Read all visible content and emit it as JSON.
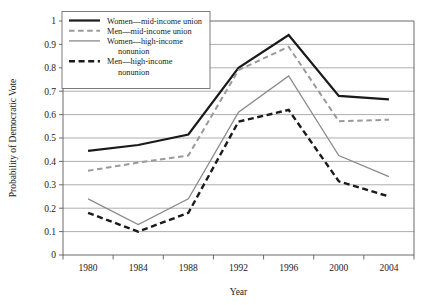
{
  "chart_data": {
    "type": "line",
    "title": "",
    "xlabel": "Year",
    "ylabel": "Probability of Democratic Vote",
    "categories": [
      "1980",
      "1984",
      "1988",
      "1992",
      "1996",
      "2000",
      "2004"
    ],
    "x": [
      1980,
      1984,
      1988,
      1992,
      1996,
      2000,
      2004
    ],
    "ylim": [
      0,
      1
    ],
    "yticks": [
      "0",
      "0.1",
      "0.2",
      "0.3",
      "0.4",
      "0.5",
      "0.6",
      "0.7",
      "0.8",
      "0.9",
      "1"
    ],
    "ytick_values": [
      0,
      0.1,
      0.2,
      0.3,
      0.4,
      0.5,
      0.6,
      0.7,
      0.8,
      0.9,
      1
    ],
    "grid": "horizontal",
    "legend_position": "top-left-inside",
    "series": [
      {
        "name": "Women—mid-income union",
        "values": [
          0.445,
          0.47,
          0.515,
          0.8,
          0.94,
          0.68,
          0.665
        ],
        "color": "#1a1a1a",
        "style": "solid",
        "width": 2.2
      },
      {
        "name": "Men—mid-income union",
        "values": [
          0.36,
          0.395,
          0.425,
          0.79,
          0.89,
          0.572,
          0.578
        ],
        "color": "#9a9a9a",
        "style": "dashed",
        "width": 2.0
      },
      {
        "name": "Women—high-income nonunion",
        "values": [
          0.24,
          0.13,
          0.24,
          0.61,
          0.765,
          0.425,
          0.335
        ],
        "color": "#8a8a8a",
        "style": "solid",
        "width": 1.3
      },
      {
        "name": "Men—high-income nonunion",
        "values": [
          0.18,
          0.1,
          0.18,
          0.57,
          0.62,
          0.315,
          0.25
        ],
        "color": "#1a1a1a",
        "style": "dashed",
        "width": 2.4
      }
    ]
  },
  "legend": {
    "entries": [
      {
        "line1": "Women—mid-income union",
        "line2": ""
      },
      {
        "line1": "Men—mid-income union",
        "line2": ""
      },
      {
        "line1": "Women—high-income",
        "line2": "nonunion"
      },
      {
        "line1": "Men—high-income",
        "line2": "nonunion"
      }
    ]
  },
  "axes": {
    "x_title": "Year",
    "y_title": "Probability of Democratic Vote"
  }
}
